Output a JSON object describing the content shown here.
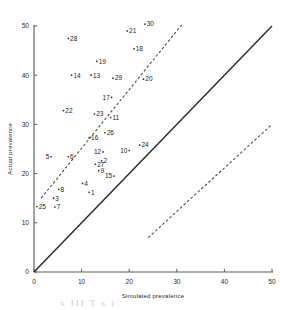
{
  "figure": {
    "background": "#ffffff",
    "ink_color": "#262626",
    "axis_color": "#5b5b5b",
    "bleed_through_text": "x  III   T     s          i"
  },
  "chart_data": {
    "type": "scatter",
    "title": "",
    "xlabel": "Simulated prevalence",
    "ylabel": "Actual prevalence",
    "xlim": [
      0,
      50
    ],
    "ylim": [
      0,
      50
    ],
    "xticks": [
      0,
      10,
      20,
      30,
      40,
      50
    ],
    "yticks": [
      0,
      10,
      20,
      30,
      40,
      50
    ],
    "xtick_labels": [
      "0",
      "10",
      "20",
      "30",
      "40",
      "50"
    ],
    "ytick_labels": [
      "0",
      "10",
      "20",
      "30",
      "40",
      "50"
    ],
    "grid": false,
    "legend": null,
    "point_label_field": "label",
    "points": [
      {
        "label": "25",
        "x": 0.6,
        "y": 13.3,
        "label_side": "right"
      },
      {
        "label": "7",
        "x": 4.4,
        "y": 13.2,
        "label_side": "right"
      },
      {
        "label": "3",
        "x": 4.1,
        "y": 15.0,
        "label_side": "right"
      },
      {
        "label": "8",
        "x": 5.2,
        "y": 16.8,
        "label_side": "right"
      },
      {
        "label": "1",
        "x": 11.6,
        "y": 16.2,
        "label_side": "right"
      },
      {
        "label": "4",
        "x": 10.2,
        "y": 18.0,
        "label_side": "right"
      },
      {
        "label": "15",
        "x": 16.8,
        "y": 19.5,
        "label_side": "left"
      },
      {
        "label": "9",
        "x": 13.6,
        "y": 20.6,
        "label_side": "right"
      },
      {
        "label": "27",
        "x": 12.9,
        "y": 21.9,
        "label_side": "right"
      },
      {
        "label": "2",
        "x": 14.2,
        "y": 22.6,
        "label_side": "right"
      },
      {
        "label": "5",
        "x": 3.6,
        "y": 23.4,
        "label_side": "left"
      },
      {
        "label": "6",
        "x": 7.2,
        "y": 23.4,
        "label_side": "right"
      },
      {
        "label": "12",
        "x": 14.5,
        "y": 24.4,
        "label_side": "left"
      },
      {
        "label": "10",
        "x": 20.0,
        "y": 24.7,
        "label_side": "left"
      },
      {
        "label": "24",
        "x": 22.2,
        "y": 25.8,
        "label_side": "right"
      },
      {
        "label": "16",
        "x": 11.6,
        "y": 27.3,
        "label_side": "right"
      },
      {
        "label": "26",
        "x": 14.9,
        "y": 28.3,
        "label_side": "right"
      },
      {
        "label": "11",
        "x": 16.1,
        "y": 31.4,
        "label_side": "right"
      },
      {
        "label": "23",
        "x": 12.7,
        "y": 32.1,
        "label_side": "right"
      },
      {
        "label": "22",
        "x": 6.2,
        "y": 32.8,
        "label_side": "right"
      },
      {
        "label": "17",
        "x": 16.3,
        "y": 35.5,
        "label_side": "left"
      },
      {
        "label": "20",
        "x": 23.0,
        "y": 39.2,
        "label_side": "right"
      },
      {
        "label": "29",
        "x": 16.6,
        "y": 39.4,
        "label_side": "right"
      },
      {
        "label": "13",
        "x": 12.0,
        "y": 40.0,
        "label_side": "right"
      },
      {
        "label": "14",
        "x": 7.9,
        "y": 40.0,
        "label_side": "right"
      },
      {
        "label": "19",
        "x": 13.2,
        "y": 42.8,
        "label_side": "right"
      },
      {
        "label": "18",
        "x": 21.0,
        "y": 45.4,
        "label_side": "right"
      },
      {
        "label": "28",
        "x": 7.2,
        "y": 47.5,
        "label_side": "right"
      },
      {
        "label": "21",
        "x": 19.6,
        "y": 49.0,
        "label_side": "right"
      },
      {
        "label": "30",
        "x": 23.3,
        "y": 50.4,
        "label_side": "right"
      }
    ],
    "reference_lines": [
      {
        "name": "identity-line",
        "style": "solid",
        "from": [
          0,
          0
        ],
        "to": [
          50,
          50
        ],
        "description": "y = x line of perfect agreement"
      },
      {
        "name": "upper-dashed-line",
        "style": "dashed",
        "from": [
          1.5,
          15.0
        ],
        "to": [
          31.0,
          50.2
        ],
        "description": "upper limit of agreement"
      },
      {
        "name": "lower-dashed-line",
        "style": "dashed",
        "from": [
          24.0,
          7.0
        ],
        "to": [
          50.0,
          30.0
        ],
        "description": "lower limit of agreement"
      }
    ]
  }
}
